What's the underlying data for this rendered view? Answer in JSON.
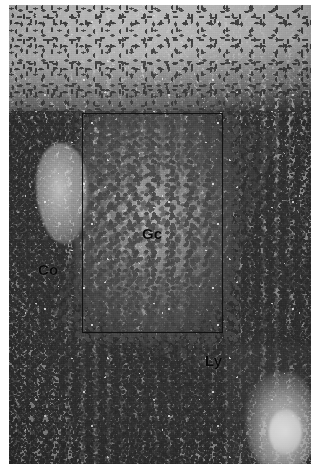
{
  "figure": {
    "kind": "histopathology-micrograph",
    "staining": "hematoxylin-eosin",
    "rendering": "grayscale",
    "background_color": "#ffffff",
    "tissue_midtone_color": "#8d8d8d",
    "nucleus_color": "#2d2d2d",
    "annotation_color": "#0a0a0a"
  },
  "roi": {
    "shape": "rectangle",
    "stroke_color": "#111111",
    "stroke_width_px": 1.5,
    "x_px": 82,
    "y_px": 113,
    "width_px": 141,
    "height_px": 220
  },
  "labels": [
    {
      "id": "gc",
      "text": "Gc",
      "x_px": 142,
      "y_px": 226,
      "region": "germinal-center"
    },
    {
      "id": "co",
      "text": "Co",
      "x_px": 38,
      "y_px": 262,
      "region": "cortex"
    },
    {
      "id": "ly",
      "text": "Ly",
      "x_px": 205,
      "y_px": 353,
      "region": "lymphocytes"
    }
  ],
  "regions": {
    "top_band": "pale fibrous spindle-cell zone",
    "center": "pale germinal center with large spaced nuclei",
    "periphery": "dense small dark lymphocyte nuclei",
    "lower_right": "bright vessel / clear space"
  }
}
